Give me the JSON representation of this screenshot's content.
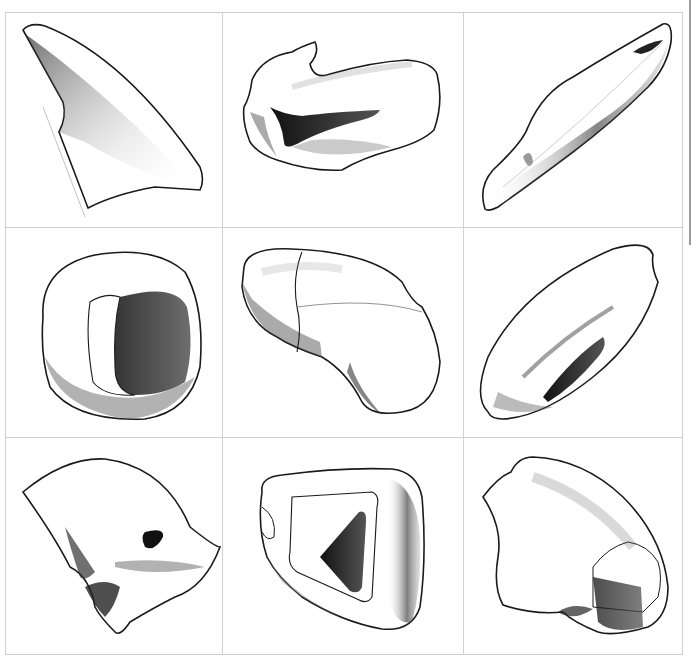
{
  "grid": {
    "rows": 3,
    "cols": 3,
    "line_color": "#d2d2d2",
    "ink_color": "#1a1a1a"
  },
  "cells": [
    {
      "row": 1,
      "col": 1,
      "label": "Curved fin / shark-fin shaped wedge"
    },
    {
      "row": 1,
      "col": 2,
      "label": "Lumpy block with dark triangular recess"
    },
    {
      "row": 1,
      "col": 3,
      "label": "Elongated diagonal torpedo form"
    },
    {
      "row": 2,
      "col": 1,
      "label": "Rounded ring with oval opening"
    },
    {
      "row": 2,
      "col": 2,
      "label": "Kidney-shaped pebble with seam line"
    },
    {
      "row": 2,
      "col": 3,
      "label": "Elliptical seed form with slot"
    },
    {
      "row": 3,
      "col": 1,
      "label": "Folded fabric-like form with tube hole"
    },
    {
      "row": 3,
      "col": 2,
      "label": "Rounded block with triangular aperture"
    },
    {
      "row": 3,
      "col": 3,
      "label": "Domed shell shape with cut facet"
    }
  ]
}
